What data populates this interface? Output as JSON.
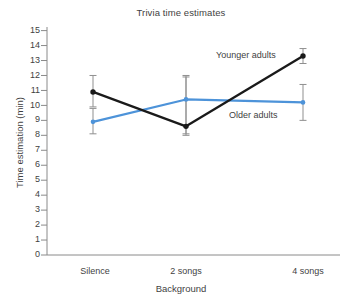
{
  "chart_data": {
    "type": "line",
    "title": "Trivia time estimates",
    "xlabel": "Background",
    "ylabel": "Time estimation (min)",
    "categories": [
      "Silence",
      "2 songs",
      "4 songs"
    ],
    "ylim": [
      0,
      15
    ],
    "yticks": [
      0,
      1,
      2,
      3,
      4,
      5,
      6,
      7,
      8,
      9,
      10,
      11,
      12,
      13,
      14,
      15
    ],
    "grid": false,
    "legend_position": "inline-annotation",
    "series": [
      {
        "name": "Younger adults",
        "color": "#1a1a1a",
        "values": [
          10.9,
          8.6,
          13.3
        ],
        "error_low": [
          9.9,
          8.0,
          12.8
        ],
        "error_high": [
          12.0,
          12.0,
          13.8
        ]
      },
      {
        "name": "Older adults",
        "color": "#4d93d9",
        "values": [
          8.9,
          10.4,
          10.2
        ],
        "error_low": [
          8.1,
          8.1,
          9.0
        ],
        "error_high": [
          9.8,
          11.9,
          11.4
        ]
      }
    ]
  },
  "axis": {
    "y_tick_labels": [
      "15",
      "14",
      "13",
      "12",
      "11",
      "10",
      "9",
      "8",
      "7",
      "6",
      "5",
      "4",
      "3",
      "2",
      "1",
      "0"
    ],
    "x_tick_labels": [
      "Silence",
      "2 songs",
      "4 songs"
    ]
  },
  "annotations": {
    "younger_label": "Younger adults",
    "older_label": "Older adults"
  }
}
